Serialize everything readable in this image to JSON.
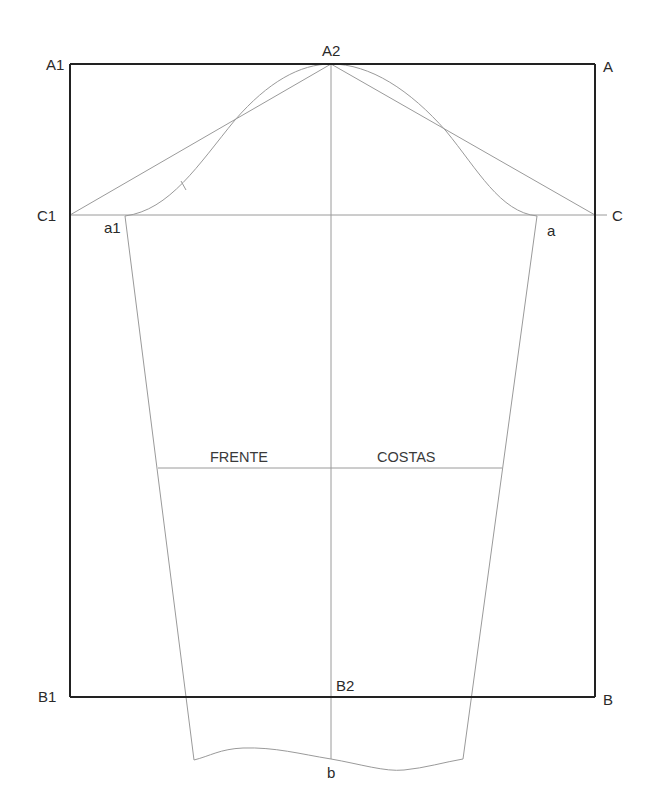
{
  "diagram": {
    "type": "sleeve-pattern-draft",
    "colors": {
      "frame": "#222222",
      "construction": "#9a9a9a",
      "text": "#2a2a2a",
      "background": "#ffffff"
    },
    "points": {
      "A1": {
        "label": "A1",
        "x": 70,
        "y": 64
      },
      "A2": {
        "label": "A2",
        "x": 331,
        "y": 64
      },
      "A": {
        "label": "A",
        "x": 595,
        "y": 64
      },
      "C1": {
        "label": "C1",
        "x": 70,
        "y": 215
      },
      "C": {
        "label": "C",
        "x": 595,
        "y": 215
      },
      "a1": {
        "label": "a1",
        "x": 125,
        "y": 216
      },
      "a": {
        "label": "a",
        "x": 537,
        "y": 216
      },
      "B1": {
        "label": "B1",
        "x": 70,
        "y": 697
      },
      "B2": {
        "label": "B2",
        "x": 331,
        "y": 697
      },
      "B": {
        "label": "B",
        "x": 595,
        "y": 697
      },
      "b": {
        "label": "b",
        "x": 331,
        "y": 759
      }
    },
    "regions": {
      "front": "FRENTE",
      "back": "COSTAS"
    }
  }
}
